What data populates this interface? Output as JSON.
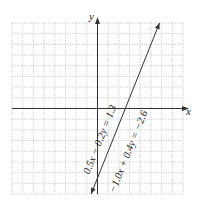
{
  "chart_data": {
    "type": "line",
    "title": "",
    "xlabel": "x",
    "ylabel": "y",
    "xlim": [
      -8,
      8
    ],
    "ylim": [
      -8,
      8
    ],
    "grid": true,
    "grid_step": 1,
    "tick_labels": false,
    "series": [
      {
        "name": "0.5x − 0.2y = 1.3",
        "equation": "0.5x - 0.2y = 1.3",
        "slope": 2.5,
        "intercept": -6.5
      },
      {
        "name": "−1.0x + 0.4y = −2.6",
        "equation": "-1.0x + 0.4y = -2.6",
        "slope": 2.5,
        "intercept": -6.5
      }
    ],
    "note": "Both equations describe the same (coincident) line",
    "line_endpoints": [
      [
        -0.6,
        -8
      ],
      [
        5.8,
        8
      ]
    ],
    "annotations": [
      "0.5x − 0.2y = 1.3",
      "−1.0x + 0.4y = −2.6"
    ]
  },
  "labels": {
    "x_axis": "x",
    "y_axis": "y",
    "eq1": "0.5x − 0.2y = 1.3",
    "eq2": "−1.0x + 0.4y = −2.6"
  }
}
